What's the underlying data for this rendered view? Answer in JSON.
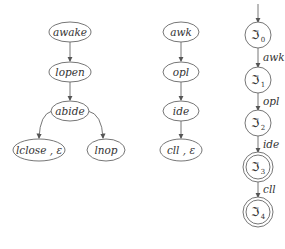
{
  "tree": {
    "nodes": [
      {
        "id": "awake",
        "label": "awake",
        "cx": 70,
        "cy": 32,
        "rx": 21,
        "ry": 10
      },
      {
        "id": "lopen",
        "label": "lopen",
        "cx": 70,
        "cy": 72,
        "rx": 21,
        "ry": 10
      },
      {
        "id": "abide",
        "label": "abide",
        "cx": 70,
        "cy": 111,
        "rx": 19,
        "ry": 10
      },
      {
        "id": "lclose",
        "label": "lclose , ε",
        "cx": 39,
        "cy": 150,
        "rx": 26,
        "ry": 11
      },
      {
        "id": "lnop",
        "label": "lnop",
        "cx": 106,
        "cy": 150,
        "rx": 19,
        "ry": 11
      }
    ]
  },
  "chain": {
    "nodes": [
      {
        "id": "awk",
        "label": "awk",
        "cx": 181,
        "cy": 32,
        "rx": 18,
        "ry": 10
      },
      {
        "id": "opl",
        "label": "opl",
        "cx": 181,
        "cy": 72,
        "rx": 18,
        "ry": 10
      },
      {
        "id": "ide",
        "label": "ide",
        "cx": 181,
        "cy": 111,
        "rx": 18,
        "ry": 10
      },
      {
        "id": "cll",
        "label": "cll , ε",
        "cx": 181,
        "cy": 150,
        "rx": 21,
        "ry": 11
      }
    ]
  },
  "automaton": {
    "states": [
      {
        "id": "s0",
        "label": "ℑ",
        "sub": "0",
        "cy": 35,
        "final": false
      },
      {
        "id": "s1",
        "label": "ℑ",
        "sub": "1",
        "cy": 80,
        "final": false
      },
      {
        "id": "s2",
        "label": "ℑ",
        "sub": "2",
        "cy": 123,
        "final": false
      },
      {
        "id": "s3",
        "label": "ℑ",
        "sub": "3",
        "cy": 167,
        "final": true
      },
      {
        "id": "s4",
        "label": "ℑ",
        "sub": "4",
        "cy": 212,
        "final": true
      }
    ],
    "transitions": [
      "awk",
      "opl",
      "ide",
      "cll"
    ]
  }
}
